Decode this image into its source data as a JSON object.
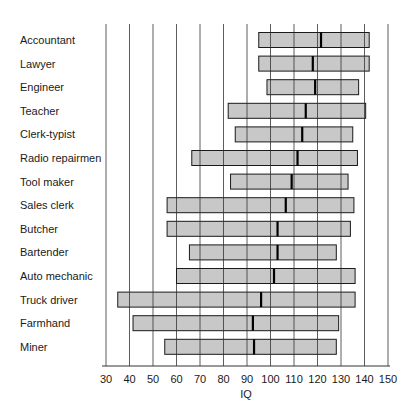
{
  "chart_data": {
    "type": "bar",
    "subtype": "range-bar-with-median",
    "title": "",
    "xlabel": "IQ",
    "ylabel": "",
    "xlim": [
      30,
      150
    ],
    "xticks": [
      30,
      40,
      50,
      60,
      70,
      80,
      90,
      100,
      110,
      120,
      130,
      140,
      150
    ],
    "grid": "vertical",
    "legend": null,
    "categories": [
      "Accountant",
      "Lawyer",
      "Engineer",
      "Teacher",
      "Clerk-typist",
      "Radio repairmen",
      "Tool maker",
      "Sales clerk",
      "Butcher",
      "Bartender",
      "Auto mechanic",
      "Truck driver",
      "Farmhand",
      "Miner"
    ],
    "series": [
      {
        "name": "low",
        "values": [
          95,
          95,
          98.5,
          82,
          85,
          66.5,
          83,
          56,
          56,
          65.5,
          60,
          35,
          41.5,
          55
        ]
      },
      {
        "name": "high",
        "values": [
          142,
          142,
          137.5,
          140.5,
          135,
          137,
          133,
          135.5,
          134,
          128,
          136,
          136,
          129,
          128
        ]
      },
      {
        "name": "median",
        "values": [
          121.5,
          118,
          119,
          115,
          113.5,
          111.5,
          109,
          106.5,
          103,
          103,
          101.5,
          96,
          92.5,
          93
        ]
      }
    ],
    "colors": {
      "bar_fill": "#c8c8c8",
      "bar_stroke": "#1a1a1a",
      "median": "#000000",
      "grid": "#333333"
    }
  }
}
